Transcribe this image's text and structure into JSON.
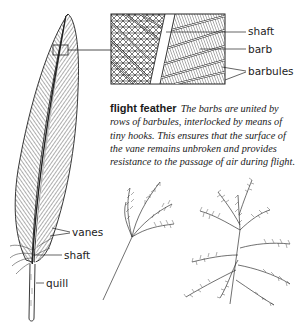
{
  "figure": {
    "title": "flight feather",
    "caption": "The barbs are united by rows of barbules, interlocked by means of tiny hooks. This ensures that the surface of the vane remains unbroken and provides resistance to the passage of air during flight.",
    "detail_labels": {
      "shaft": "shaft",
      "barb": "barb",
      "barbules": "barbules"
    },
    "feather_labels": {
      "vanes": "vanes",
      "shaft": "shaft",
      "quill": "quill"
    }
  },
  "colors": {
    "ink": "#1a1a1a",
    "background": "#ffffff"
  }
}
